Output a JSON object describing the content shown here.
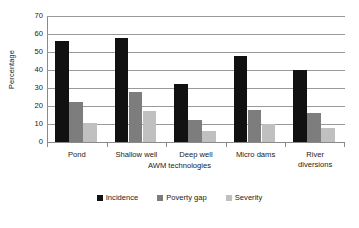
{
  "chart_data": {
    "type": "bar",
    "title": "",
    "xlabel": "AWM technologies",
    "ylabel": "Percentage",
    "categories": [
      "Pond",
      "Shallow well",
      "Deep well",
      "Micro dams",
      "River diversions"
    ],
    "category_lines": [
      [
        "Pond"
      ],
      [
        "Shallow well"
      ],
      [
        "Deep well"
      ],
      [
        "Micro dams"
      ],
      [
        "River",
        "diversions"
      ]
    ],
    "series": [
      {
        "name": "Incidence",
        "color": "#111111",
        "values": [
          56,
          58,
          32,
          48,
          40
        ]
      },
      {
        "name": "Poverty gap",
        "color": "#7d7d7d",
        "values": [
          22,
          28,
          12,
          18,
          16
        ]
      },
      {
        "name": "Severity",
        "color": "#c0c0c0",
        "values": [
          10.5,
          17.5,
          6,
          10,
          8
        ]
      }
    ],
    "ylim": [
      0,
      70
    ],
    "ytick_step": 10,
    "yticks": [
      70,
      60,
      50,
      40,
      30,
      20,
      10,
      0
    ],
    "grid": "horizontal",
    "legend_position": "bottom"
  }
}
